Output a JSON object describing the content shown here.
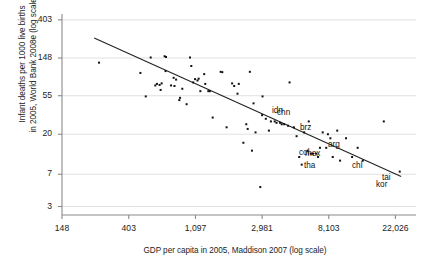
{
  "chart_data": {
    "type": "scatter",
    "title": "",
    "xlabel": "GDP per capita in 2005, Maddison 2007 (log scale)",
    "ylabel": "Infant deaths per 1000 live births in 2005, World Bank 2008e (log scale)",
    "ylabel_line1": "Infant deaths per 1000 live births",
    "ylabel_line2": "in 2005, World Bank 2008e (log scale)",
    "x_scale": "log",
    "y_scale": "log",
    "xticks": [
      148,
      403,
      1097,
      2981,
      8103,
      22026
    ],
    "xtick_labels": [
      "148",
      "403",
      "1,097",
      "2,981",
      "8,103",
      "22,026"
    ],
    "yticks": [
      3,
      7,
      20,
      55,
      148,
      403
    ],
    "ytick_labels": [
      "3",
      "7",
      "20",
      "55",
      "148",
      "403"
    ],
    "xlim": [
      148,
      30000
    ],
    "ylim": [
      2.4,
      470
    ],
    "grid": "horizontal",
    "grid_color": "#d9d9d9",
    "point_color": "#111111",
    "line_color": "#222222",
    "marker": "square",
    "marker_size": 2,
    "fit_line": {
      "label": "linear fit (log-log)",
      "x_start": 240,
      "y_start": 250,
      "x_end": 24000,
      "y_end": 6.6
    },
    "points": [
      {
        "x": 258,
        "y": 131
      },
      {
        "x": 480,
        "y": 100
      },
      {
        "x": 520,
        "y": 54
      },
      {
        "x": 560,
        "y": 150
      },
      {
        "x": 600,
        "y": 72
      },
      {
        "x": 615,
        "y": 75
      },
      {
        "x": 640,
        "y": 73
      },
      {
        "x": 650,
        "y": 64
      },
      {
        "x": 660,
        "y": 76
      },
      {
        "x": 690,
        "y": 155
      },
      {
        "x": 700,
        "y": 105
      },
      {
        "x": 705,
        "y": 152
      },
      {
        "x": 760,
        "y": 72
      },
      {
        "x": 790,
        "y": 88
      },
      {
        "x": 800,
        "y": 71
      },
      {
        "x": 820,
        "y": 84
      },
      {
        "x": 860,
        "y": 49
      },
      {
        "x": 870,
        "y": 52
      },
      {
        "x": 900,
        "y": 66
      },
      {
        "x": 960,
        "y": 44
      },
      {
        "x": 1010,
        "y": 150
      },
      {
        "x": 1030,
        "y": 120
      },
      {
        "x": 1060,
        "y": 78
      },
      {
        "x": 1090,
        "y": 85
      },
      {
        "x": 1130,
        "y": 82
      },
      {
        "x": 1150,
        "y": 86
      },
      {
        "x": 1180,
        "y": 62
      },
      {
        "x": 1250,
        "y": 97
      },
      {
        "x": 1270,
        "y": 75
      },
      {
        "x": 1330,
        "y": 62
      },
      {
        "x": 1360,
        "y": 62
      },
      {
        "x": 1420,
        "y": 31
      },
      {
        "x": 1600,
        "y": 103
      },
      {
        "x": 1640,
        "y": 102
      },
      {
        "x": 1750,
        "y": 24
      },
      {
        "x": 1900,
        "y": 76
      },
      {
        "x": 1960,
        "y": 71
      },
      {
        "x": 2060,
        "y": 58
      },
      {
        "x": 2100,
        "y": 75
      },
      {
        "x": 2250,
        "y": 16
      },
      {
        "x": 2350,
        "y": 26
      },
      {
        "x": 2400,
        "y": 23
      },
      {
        "x": 2480,
        "y": 103
      },
      {
        "x": 2560,
        "y": 13
      },
      {
        "x": 2620,
        "y": 45
      },
      {
        "x": 2700,
        "y": 21
      },
      {
        "x": 2900,
        "y": 5
      },
      {
        "x": 2980,
        "y": 33
      },
      {
        "x": 3000,
        "y": 54
      },
      {
        "x": 3150,
        "y": 30
      },
      {
        "x": 3300,
        "y": 22
      },
      {
        "x": 3400,
        "y": 28
      },
      {
        "x": 3600,
        "y": 28
      },
      {
        "x": 3700,
        "y": 27
      },
      {
        "x": 3900,
        "y": 27
      },
      {
        "x": 4000,
        "y": 26
      },
      {
        "x": 4150,
        "y": 26
      },
      {
        "x": 4400,
        "y": 25
      },
      {
        "x": 4500,
        "y": 78
      },
      {
        "x": 4800,
        "y": 24
      },
      {
        "x": 5000,
        "y": 19
      },
      {
        "x": 5200,
        "y": 11
      },
      {
        "x": 5400,
        "y": 9
      },
      {
        "x": 5600,
        "y": 21
      },
      {
        "x": 5900,
        "y": 13
      },
      {
        "x": 6000,
        "y": 28
      },
      {
        "x": 6200,
        "y": 12
      },
      {
        "x": 6400,
        "y": 12
      },
      {
        "x": 6700,
        "y": 12
      },
      {
        "x": 6900,
        "y": 11
      },
      {
        "x": 7100,
        "y": 14
      },
      {
        "x": 7400,
        "y": 21
      },
      {
        "x": 7800,
        "y": 14
      },
      {
        "x": 8000,
        "y": 20
      },
      {
        "x": 8300,
        "y": 18
      },
      {
        "x": 8600,
        "y": 11
      },
      {
        "x": 9200,
        "y": 22
      },
      {
        "x": 9600,
        "y": 10
      },
      {
        "x": 10500,
        "y": 18
      },
      {
        "x": 11500,
        "y": 11
      },
      {
        "x": 12500,
        "y": 14
      },
      {
        "x": 13500,
        "y": 10
      },
      {
        "x": 18500,
        "y": 28
      },
      {
        "x": 23500,
        "y": 7.5
      }
    ],
    "labels": [
      {
        "text": "idn",
        "x": 272,
        "y": 106
      },
      {
        "text": "chn",
        "x": 277,
        "y": 108
      },
      {
        "text": "brz",
        "x": 300,
        "y": 123
      },
      {
        "text": "arg",
        "x": 328,
        "y": 140
      },
      {
        "text": "col",
        "x": 299,
        "y": 148
      },
      {
        "text": "mex",
        "x": 305,
        "y": 149
      },
      {
        "text": "tha",
        "x": 304,
        "y": 161
      },
      {
        "text": "chl",
        "x": 352,
        "y": 161
      },
      {
        "text": "tai",
        "x": 382,
        "y": 173
      },
      {
        "text": "kor",
        "x": 376,
        "y": 180
      }
    ]
  }
}
